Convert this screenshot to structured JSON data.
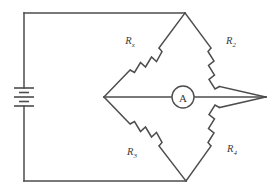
{
  "diagram": {
    "background_color": "#ffffff",
    "line_color": "#4d4d4d",
    "text_color": "#3a3a3a"
  },
  "source": {
    "name": "battery",
    "symbol": "multi-cell-battery",
    "label": ""
  },
  "meter": {
    "name": "ammeter",
    "label": "A"
  },
  "resistors": [
    {
      "id": "rx",
      "base": "R",
      "subscript": "x",
      "label": "Rx",
      "position": "upper-left"
    },
    {
      "id": "r2",
      "base": "R",
      "subscript": "2",
      "label": "R2",
      "position": "upper-right"
    },
    {
      "id": "r3",
      "base": "R",
      "subscript": "3",
      "label": "R3",
      "position": "lower-left"
    },
    {
      "id": "r4",
      "base": "R",
      "subscript": "4",
      "label": "R4",
      "position": "lower-right"
    }
  ]
}
